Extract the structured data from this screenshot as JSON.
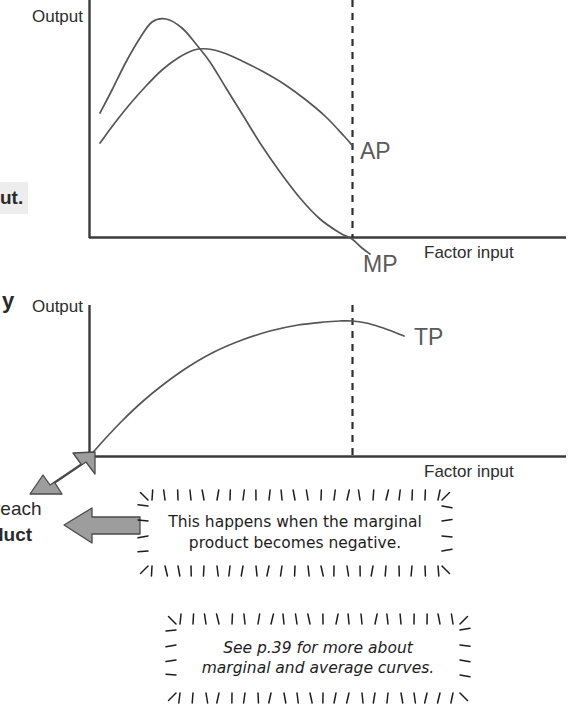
{
  "figure": {
    "fragments": {
      "output_sentence_tail": "ut.",
      "paragraph_y": "y",
      "reach": "reach",
      "duct": "duct"
    },
    "colors": {
      "axis": "#3b3b3b",
      "curve": "#555555",
      "dashed_guide": "#2f2f2f",
      "curve_label": "#5a5a5a",
      "arrow_fill": "#9a9a9a",
      "arrow_stroke": "#4a4a4a",
      "highlight_background": "#ededed"
    },
    "callouts": [
      {
        "id": "marginal-product-note",
        "line1": "This happens when the marginal",
        "line2": "product becomes negative."
      },
      {
        "id": "see-page-note",
        "line1": "See p.39 for more about",
        "line2": "marginal and average curves."
      }
    ],
    "arrows": [
      {
        "id": "arrow-to-tp-origin",
        "direction": "up-right",
        "points_to": "origin of total product chart"
      },
      {
        "id": "arrow-to-duct-text",
        "direction": "left",
        "points_to": "body text at left margin"
      }
    ]
  },
  "chart_data": [
    {
      "type": "line",
      "id": "ap-mp-chart",
      "title": "",
      "xlabel": "Factor input",
      "ylabel": "Output",
      "grid": false,
      "axis_origin_px": [
        89,
        238
      ],
      "axis_right_px": 565,
      "axis_top_px": 0,
      "guide_line": {
        "label": "",
        "x_px": 352,
        "note": "marginal product crosses zero"
      },
      "series": [
        {
          "name": "MP",
          "label": "MP",
          "label_pos_px": [
            363,
            258
          ],
          "description": "marginal product: rises to an early high peak then falls steeply through zero and becomes negative",
          "points_px": [
            [
              100,
              113
            ],
            [
              112,
              90
            ],
            [
              126,
              62
            ],
            [
              140,
              38
            ],
            [
              152,
              22
            ],
            [
              166,
              19
            ],
            [
              182,
              28
            ],
            [
              196,
              44
            ],
            [
              210,
              62
            ],
            [
              226,
              88
            ],
            [
              244,
              117
            ],
            [
              262,
              146
            ],
            [
              280,
              172
            ],
            [
              300,
              198
            ],
            [
              320,
              219
            ],
            [
              340,
              233
            ],
            [
              352,
              239
            ],
            [
              362,
              248
            ],
            [
              370,
              254
            ]
          ]
        },
        {
          "name": "AP",
          "label": "AP",
          "label_pos_px": [
            360,
            159
          ],
          "description": "average product: rises to a later, lower peak then declines gently, cut by MP from above",
          "points_px": [
            [
              100,
              143
            ],
            [
              114,
              124
            ],
            [
              130,
              104
            ],
            [
              146,
              86
            ],
            [
              162,
              70
            ],
            [
              178,
              58
            ],
            [
              194,
              50
            ],
            [
              208,
              49
            ],
            [
              224,
              53
            ],
            [
              242,
              61
            ],
            [
              262,
              71
            ],
            [
              284,
              84
            ],
            [
              306,
              100
            ],
            [
              326,
              117
            ],
            [
              344,
              136
            ],
            [
              352,
              145
            ]
          ]
        }
      ]
    },
    {
      "type": "line",
      "id": "tp-chart",
      "title": "",
      "xlabel": "Factor input",
      "ylabel": "Output",
      "grid": false,
      "axis_origin_px": [
        89,
        457
      ],
      "axis_right_px": 565,
      "axis_top_px": 305,
      "guide_line": {
        "label": "",
        "x_px": 352,
        "note": "total product reaches its maximum"
      },
      "series": [
        {
          "name": "TP",
          "label": "TP",
          "label_pos_px": [
            414,
            337
          ],
          "description": "total product: rises from the origin at a decreasing rate to a maximum at the guide line, then turns down",
          "points_px": [
            [
              89,
              457
            ],
            [
              104,
              440
            ],
            [
              122,
              421
            ],
            [
              142,
              402
            ],
            [
              164,
              384
            ],
            [
              188,
              367
            ],
            [
              214,
              352
            ],
            [
              242,
              340
            ],
            [
              270,
              331
            ],
            [
              298,
              325
            ],
            [
              324,
              322
            ],
            [
              340,
              321
            ],
            [
              352,
              321
            ],
            [
              366,
              323
            ],
            [
              380,
              327
            ],
            [
              394,
              332
            ],
            [
              404,
              336
            ]
          ]
        }
      ]
    }
  ]
}
